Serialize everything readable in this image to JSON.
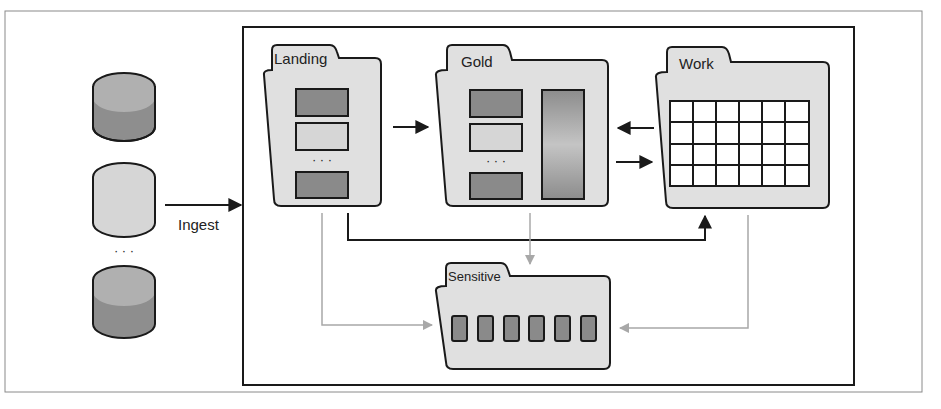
{
  "diagram": {
    "ingest_label": "Ingest",
    "ellipsis": "...",
    "sources": [
      {
        "name": "source-1",
        "shade": "dark"
      },
      {
        "name": "source-2",
        "shade": "light"
      },
      {
        "name": "source-n",
        "shade": "dark"
      }
    ],
    "zones": {
      "landing": {
        "label": "Landing",
        "items": [
          "dark",
          "light",
          "...",
          "dark"
        ]
      },
      "gold": {
        "label": "Gold",
        "items": [
          "dark",
          "light",
          "...",
          "dark"
        ],
        "has_gradient_column": true
      },
      "work": {
        "label": "Work",
        "grid": {
          "rows": 4,
          "cols": 6
        }
      },
      "sensitive": {
        "label": "Sensitive",
        "cells": 6
      }
    },
    "flows": [
      {
        "from": "sources",
        "to": "landing",
        "label": "Ingest",
        "style": "solid"
      },
      {
        "from": "landing",
        "to": "gold",
        "style": "solid"
      },
      {
        "from": "work",
        "to": "gold",
        "style": "solid"
      },
      {
        "from": "gold",
        "to": "work",
        "style": "solid"
      },
      {
        "from": "landing",
        "to": "work",
        "style": "solid"
      },
      {
        "from": "landing",
        "to": "sensitive",
        "style": "gray"
      },
      {
        "from": "gold",
        "to": "sensitive",
        "style": "gray"
      },
      {
        "from": "work",
        "to": "sensitive",
        "style": "gray"
      }
    ],
    "colors": {
      "dark_fill": "#8a8a8a",
      "light_fill": "#d6d6d6",
      "folder_fill": "#e0e0e0",
      "stroke": "#1a1a1a",
      "gray_arrow": "#a8a8a8"
    }
  }
}
